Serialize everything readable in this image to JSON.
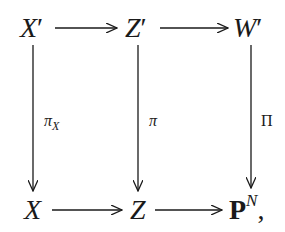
{
  "diagram": {
    "type": "commutative-diagram",
    "nodes": {
      "top_left": {
        "base": "X",
        "mark": "′"
      },
      "top_middle": {
        "base": "Z",
        "mark": "′"
      },
      "top_right": {
        "base": "W",
        "mark": "′"
      },
      "bottom_left": {
        "base": "X"
      },
      "bottom_middle": {
        "base": "Z"
      },
      "bottom_right": {
        "base": "P",
        "sup": "N",
        "trailing": ","
      }
    },
    "edges": {
      "top_1": {
        "from": "X′",
        "to": "Z′",
        "label": ""
      },
      "top_2": {
        "from": "Z′",
        "to": "W′",
        "label": ""
      },
      "bottom_1": {
        "from": "X",
        "to": "Z",
        "label": ""
      },
      "bottom_2": {
        "from": "Z",
        "to": "P^N",
        "label": ""
      },
      "left": {
        "from": "X′",
        "to": "X",
        "label_base": "π",
        "label_sub": "X"
      },
      "middle": {
        "from": "Z′",
        "to": "Z",
        "label_base": "π"
      },
      "right": {
        "from": "W′",
        "to": "P^N",
        "label_base": "Π"
      }
    },
    "colors": {
      "ink": "#1a1a1a",
      "background": "#ffffff"
    }
  }
}
